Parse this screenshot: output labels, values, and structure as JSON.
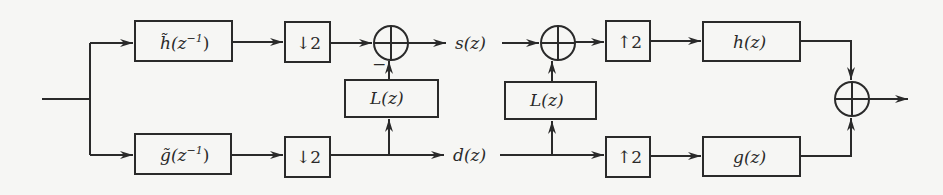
{
  "diagram": {
    "type": "lifting-scheme filter bank block diagram",
    "blocks": {
      "analysis_lowpass": {
        "func": "h̃",
        "arg": "(z",
        "exp": "−1",
        "close": ")"
      },
      "analysis_highpass": {
        "func": "g̃",
        "arg": "(z",
        "exp": "−1",
        "close": ")"
      },
      "downsample_top": {
        "arrow": "↓",
        "factor": "2"
      },
      "downsample_bottom": {
        "arrow": "↓",
        "factor": "2"
      },
      "lifting_predict": {
        "label": "L(z)"
      },
      "lifting_update": {
        "label": "L(z)"
      },
      "upsample_top": {
        "arrow": "↑",
        "factor": "2"
      },
      "upsample_bottom": {
        "arrow": "↑",
        "factor": "2"
      },
      "synthesis_lowpass": {
        "label": "h(z)"
      },
      "synthesis_highpass": {
        "label": "g(z)"
      }
    },
    "signals": {
      "s": "s(z)",
      "d": "d(z)"
    },
    "sum_signs": {
      "first_sum_lower_input": "−"
    },
    "colors": {
      "stroke": "#2a2a2a",
      "background": "#f6f6f4"
    }
  }
}
